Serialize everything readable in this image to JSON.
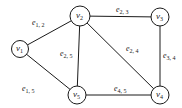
{
  "graph": {
    "nodes": [
      {
        "id": "v1",
        "base": "v",
        "sub": "1",
        "x": 20,
        "y": 49,
        "r": 8.5
      },
      {
        "id": "v2",
        "base": "v",
        "sub": "2",
        "x": 80,
        "y": 16,
        "r": 10
      },
      {
        "id": "v3",
        "base": "v",
        "sub": "3",
        "x": 160,
        "y": 17,
        "r": 9
      },
      {
        "id": "v4",
        "base": "v",
        "sub": "4",
        "x": 160,
        "y": 95,
        "r": 9
      },
      {
        "id": "v5",
        "base": "v",
        "sub": "5",
        "x": 77,
        "y": 95,
        "r": 9
      }
    ],
    "edges": [
      {
        "id": "e12",
        "from": "v1",
        "to": "v2",
        "base": "e",
        "sub": "1, 2",
        "lx": 32,
        "ly": 25
      },
      {
        "id": "e23",
        "from": "v2",
        "to": "v3",
        "base": "e",
        "sub": "2, 3",
        "lx": 116,
        "ly": 12
      },
      {
        "id": "e25",
        "from": "v2",
        "to": "v5",
        "base": "e",
        "sub": "2, 5",
        "lx": 60,
        "ly": 56
      },
      {
        "id": "e24",
        "from": "v2",
        "to": "v4",
        "base": "e",
        "sub": "2, 4",
        "lx": 126,
        "ly": 51
      },
      {
        "id": "e34",
        "from": "v3",
        "to": "v4",
        "base": "e",
        "sub": "3, 4",
        "lx": 163,
        "ly": 58
      },
      {
        "id": "e15",
        "from": "v1",
        "to": "v5",
        "base": "e",
        "sub": "1, 5",
        "lx": 22,
        "ly": 91
      },
      {
        "id": "e45",
        "from": "v4",
        "to": "v5",
        "base": "e",
        "sub": "4, 5",
        "lx": 114,
        "ly": 91
      }
    ]
  }
}
